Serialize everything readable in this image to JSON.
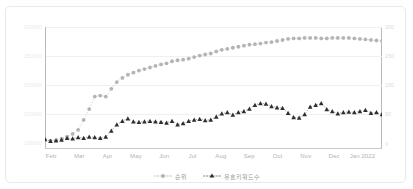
{
  "chart_data": {
    "type": "line",
    "title": "",
    "xlabel": "",
    "ylabel": "",
    "grid": true,
    "legend_position": "bottom-center",
    "dual_axis": true,
    "x_tick_labels": [
      "Feb",
      "Mar",
      "Apr",
      "May",
      "Jun",
      "Jul",
      "Aug",
      "Sep",
      "Oct",
      "Nov",
      "Dec",
      "Jan 2022"
    ],
    "left_axis": {
      "tick_labels": [
        "300000",
        "250000",
        "200000",
        "150000",
        "100000"
      ],
      "ylim": [
        75000,
        310000
      ],
      "color": "#ededed"
    },
    "right_axis": {
      "tick_labels": [
        "200",
        "150",
        "100",
        "50",
        "0"
      ],
      "ylim": [
        0,
        200
      ],
      "color": "#dadada"
    },
    "series": [
      {
        "name": "순위",
        "axis": "left",
        "marker": "circle",
        "color": "#b4b4b4",
        "line_style": "dotted",
        "values": [
          93000,
          91000,
          92000,
          95000,
          99000,
          104000,
          112000,
          131000,
          152000,
          176000,
          178000,
          176000,
          191000,
          204000,
          212000,
          218000,
          222000,
          226000,
          229000,
          232000,
          235000,
          238000,
          240000,
          244000,
          246000,
          247000,
          249000,
          252000,
          255000,
          257000,
          259000,
          263000,
          266000,
          268000,
          270000,
          272000,
          274000,
          276000,
          277000,
          278000,
          280000,
          281000,
          283000,
          285000,
          287000,
          288000,
          288000,
          289000,
          289000,
          289000,
          288000,
          288000,
          289000,
          289000,
          289000,
          289000,
          288000,
          287000,
          286000,
          285000,
          284000,
          283000
        ]
      },
      {
        "name": "유효키워드수",
        "axis": "right",
        "marker": "triangle",
        "color": "#2e2e2e",
        "line_style": "dotted",
        "values": [
          16,
          13,
          14,
          15,
          18,
          17,
          19,
          18,
          20,
          19,
          18,
          20,
          30,
          40,
          46,
          50,
          45,
          44,
          45,
          46,
          45,
          44,
          43,
          46,
          40,
          42,
          46,
          48,
          49,
          47,
          48,
          53,
          58,
          60,
          56,
          60,
          62,
          66,
          72,
          75,
          74,
          70,
          68,
          67,
          59,
          52,
          51,
          57,
          69,
          72,
          75,
          65,
          62,
          58,
          60,
          61,
          60,
          62,
          64,
          59,
          60,
          57
        ]
      }
    ]
  },
  "legend": {
    "items": [
      {
        "label": "순위",
        "marker": "circle"
      },
      {
        "label": "유효키워드수",
        "marker": "triangle"
      }
    ]
  }
}
